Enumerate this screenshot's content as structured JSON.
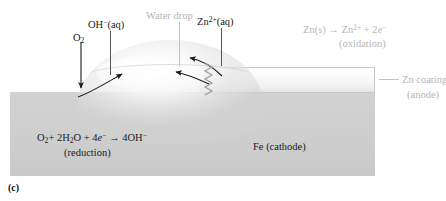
{
  "figure": {
    "panel_letter": "(c)",
    "background_color": "#ffffff"
  },
  "labels": {
    "water_drop": "Water drop",
    "oh_aq": "OH−(aq)",
    "oh_aq_base": "OH",
    "oh_aq_sup": "−",
    "oh_aq_tail": "(aq)",
    "o2_base": "O",
    "o2_sub": "2",
    "zn_ion_base": "Zn",
    "zn_ion_sup": "2+",
    "zn_ion_tail": "(aq)",
    "zn_coating": "Zn coating",
    "zn_coating_anode": "(anode)",
    "fe_cathode": "Fe (cathode)"
  },
  "equations": {
    "oxidation": {
      "line1_a": "Zn(s)",
      "line1_arrow": "→",
      "line1_b": "Zn",
      "line1_b_sup": "2+",
      "line1_plus": "+ 2",
      "line1_e": "e",
      "line1_e_sup": "−",
      "line2": "(oxidation)"
    },
    "reduction": {
      "line1_a": "O",
      "line1_a_sub": "2",
      "line1_b": "+ 2H",
      "line1_b_sub": "2",
      "line1_c": "O + 4",
      "line1_e": "e",
      "line1_e_sup": "−",
      "line1_arrow": "→",
      "line1_d": "4OH",
      "line1_d_sup": "−",
      "line2": "(reduction)"
    }
  },
  "materials": {
    "fe_block_label": "Fe (cathode)",
    "fe_block_color": "#cfcfcf",
    "zn_coating_color": "#f6f6f6",
    "water_drop_color": "#f0f0f0"
  },
  "colors": {
    "text_black": "#1a1a1a",
    "text_gray": "#b6b6b6",
    "leader_dark": "#555555",
    "leader_gray": "#c2c2c2",
    "arrow_dark": "#1a1a1a",
    "coil_gray": "#9a9a9a"
  },
  "annotations": {
    "o2_arrow_direction": "down",
    "oh_arrow_direction": "up-right",
    "zn_arrow_1_direction": "left",
    "zn_arrow_2_direction": "left",
    "electron_path": "zigzag-coil"
  }
}
